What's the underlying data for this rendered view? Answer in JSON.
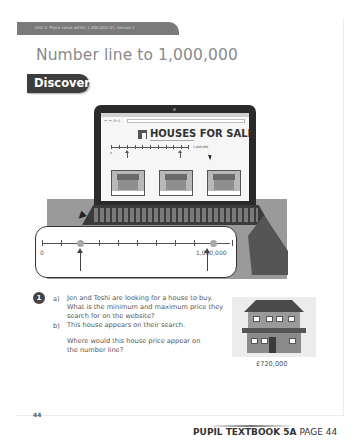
{
  "header": {
    "unit_label": "Unit 2: Place value within 1,000,000 (2), Lesson 1",
    "title": "Number line to 1,000,000",
    "section_badge": "Discover"
  },
  "illustration": {
    "website": {
      "heading": "HOUSES FOR SALE",
      "nav_buttons": "← → ⟳ ⌂",
      "mini_number_line": {
        "start": "0",
        "end": "1,000,000"
      },
      "listings": [
        {
          "name": "house-1"
        },
        {
          "name": "house-2"
        },
        {
          "name": "house-3"
        }
      ]
    },
    "number_line": {
      "start_label": "0",
      "end_label": "1,000,000",
      "min": 0,
      "max": 1000000,
      "divisions": 10,
      "markers": [
        {
          "position": 200000,
          "label": "minimum-price-marker"
        },
        {
          "position": 900000,
          "label": "maximum-price-marker"
        }
      ]
    }
  },
  "question": {
    "number": "1",
    "parts": [
      {
        "label": "a)",
        "text": "Jen and Toshi are looking for a house to buy. What is the minimum and maximum price they search for on the website?"
      },
      {
        "label": "b)",
        "text": "This house appears on their search."
      },
      {
        "label": "",
        "text": "Where would this house price appear on the number line?"
      }
    ],
    "house_price": "£720,000"
  },
  "footer": {
    "page_number": "44",
    "book_label": "PUPIL TEXTBOOK 5A",
    "page_label": "PAGE 44"
  },
  "colors": {
    "header_bar": "#7a7a7a",
    "badge": "#3d3d3d",
    "title_text": "#8a8a8a",
    "marker_dot": "#a9a9a9"
  }
}
